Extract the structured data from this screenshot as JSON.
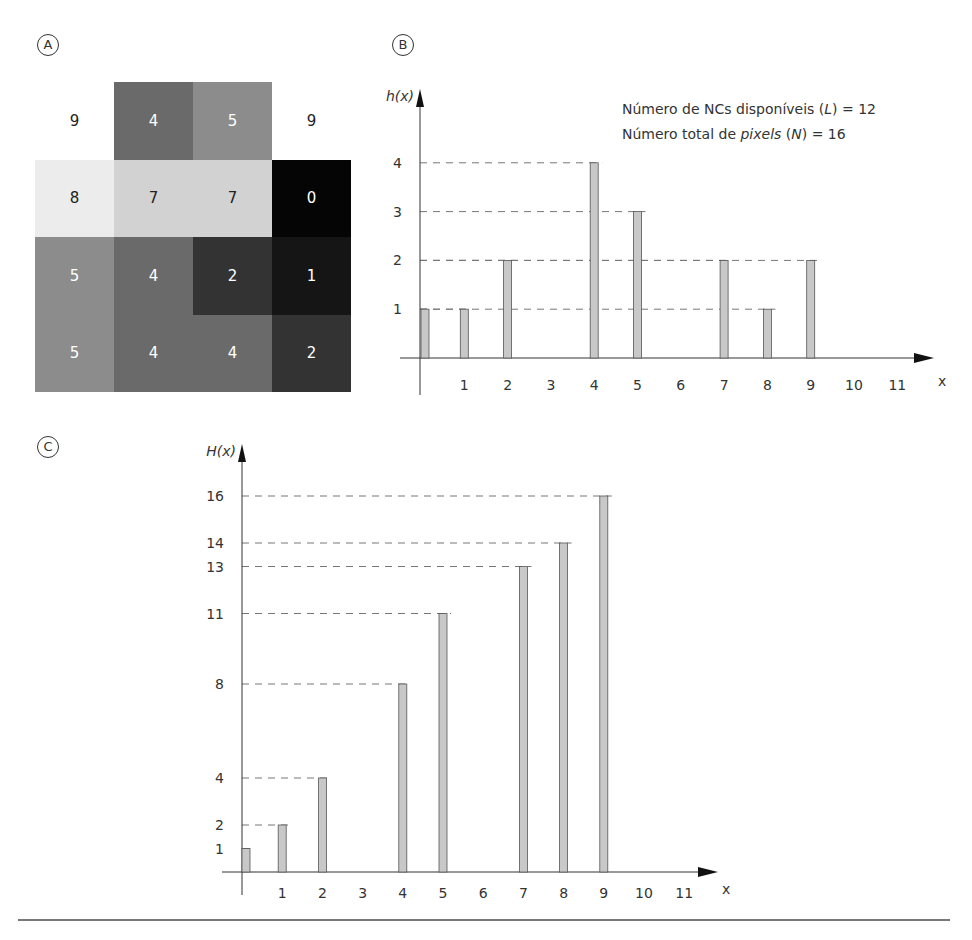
{
  "panels": {
    "a": {
      "label": "A"
    },
    "b": {
      "label": "B"
    },
    "c": {
      "label": "C"
    }
  },
  "image_grid": {
    "rows": [
      [
        {
          "v": "9",
          "fill": "#ffffff",
          "ink": "#222222"
        },
        {
          "v": "4",
          "fill": "#6a6a6a",
          "ink": "#ffffff"
        },
        {
          "v": "5",
          "fill": "#8c8c8c",
          "ink": "#ffffff"
        },
        {
          "v": "9",
          "fill": "#ffffff",
          "ink": "#222222"
        }
      ],
      [
        {
          "v": "8",
          "fill": "#ececec",
          "ink": "#222222"
        },
        {
          "v": "7",
          "fill": "#d2d2d2",
          "ink": "#222222"
        },
        {
          "v": "7",
          "fill": "#d2d2d2",
          "ink": "#222222"
        },
        {
          "v": "0",
          "fill": "#050505",
          "ink": "#ffffff"
        }
      ],
      [
        {
          "v": "5",
          "fill": "#8c8c8c",
          "ink": "#ffffff"
        },
        {
          "v": "4",
          "fill": "#6a6a6a",
          "ink": "#ffffff"
        },
        {
          "v": "2",
          "fill": "#333333",
          "ink": "#ffffff"
        },
        {
          "v": "1",
          "fill": "#151515",
          "ink": "#ffffff"
        }
      ],
      [
        {
          "v": "5",
          "fill": "#8c8c8c",
          "ink": "#ffffff"
        },
        {
          "v": "4",
          "fill": "#6a6a6a",
          "ink": "#ffffff"
        },
        {
          "v": "4",
          "fill": "#6a6a6a",
          "ink": "#ffffff"
        },
        {
          "v": "2",
          "fill": "#333333",
          "ink": "#ffffff"
        }
      ]
    ]
  },
  "legend": {
    "line1_pre": "Número de NCs disponíveis (",
    "line1_var": "L",
    "line1_post": ") = 12",
    "line2_pre": "Número total de ",
    "line2_em": "pixels",
    "line2_mid": " (",
    "line2_var": "N",
    "line2_post": ") = 16"
  },
  "colors": {
    "bar_fill": "#c8c8c8",
    "bar_stroke": "#555555",
    "axis": "#333333",
    "dash": "#777777"
  },
  "chart_data": [
    {
      "type": "bar",
      "title": "h(x) — histogram",
      "xlabel": "x",
      "ylabel": "h(x)",
      "categories": [
        0,
        1,
        2,
        3,
        4,
        5,
        6,
        7,
        8,
        9,
        10,
        11
      ],
      "values": [
        1,
        1,
        2,
        0,
        4,
        3,
        0,
        2,
        1,
        2,
        0,
        0
      ],
      "x_tick_labels": [
        "1",
        "2",
        "3",
        "4",
        "5",
        "6",
        "7",
        "8",
        "9",
        "10",
        "11"
      ],
      "y_tick_labels": [
        "1",
        "2",
        "3",
        "4"
      ],
      "ylim": [
        0,
        4
      ],
      "grid": "dashed guide lines at bar tops",
      "annotations": [
        "Número de NCs disponíveis (L) = 12",
        "Número total de pixels (N) = 16"
      ]
    },
    {
      "type": "bar",
      "title": "H(x) — cumulative histogram",
      "xlabel": "x",
      "ylabel": "H(x)",
      "categories": [
        0,
        1,
        2,
        3,
        4,
        5,
        6,
        7,
        8,
        9,
        10,
        11
      ],
      "values": [
        1,
        2,
        4,
        0,
        8,
        11,
        0,
        13,
        14,
        16,
        0,
        0
      ],
      "x_tick_labels": [
        "1",
        "2",
        "3",
        "4",
        "5",
        "6",
        "7",
        "8",
        "9",
        "10",
        "11"
      ],
      "y_tick_labels": [
        "1",
        "2",
        "4",
        "8",
        "11",
        "13",
        "14",
        "16"
      ],
      "ylim": [
        0,
        16
      ],
      "grid": "dashed guide lines at bar tops"
    }
  ]
}
